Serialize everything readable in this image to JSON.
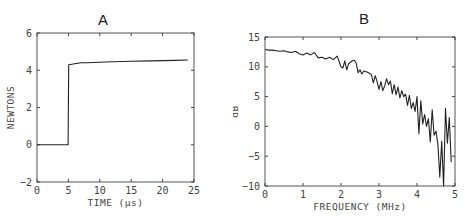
{
  "chart_data": [
    {
      "id": "A",
      "type": "line",
      "title": "A",
      "xlabel": "TIME (µs)",
      "ylabel": "NEWTONS",
      "xlim": [
        0,
        25
      ],
      "ylim": [
        -2,
        6
      ],
      "xticks": [
        "0",
        "5",
        "10",
        "15",
        "20",
        "25"
      ],
      "yticks": [
        "-2",
        "0",
        "2",
        "4",
        "6"
      ],
      "grid": false,
      "series": [
        {
          "name": "force",
          "x": [
            0,
            4.95,
            5.0,
            5.05,
            6,
            7,
            8,
            10,
            12,
            15,
            18,
            20,
            22,
            24
          ],
          "y": [
            0,
            0,
            2.2,
            4.3,
            4.35,
            4.4,
            4.4,
            4.43,
            4.46,
            4.48,
            4.5,
            4.52,
            4.53,
            4.55
          ]
        }
      ]
    },
    {
      "id": "B",
      "type": "line",
      "title": "B",
      "xlabel": "FREQUENCY (MHz)",
      "ylabel": "dB",
      "xlim": [
        0,
        5
      ],
      "ylim": [
        -10,
        15
      ],
      "xticks": [
        "0",
        "1",
        "2",
        "3",
        "4",
        "5"
      ],
      "yticks": [
        "-10",
        "-5",
        "0",
        "5",
        "10",
        "15"
      ],
      "grid": false,
      "series": [
        {
          "name": "spectrum",
          "x": [
            0,
            0.1,
            0.2,
            0.3,
            0.4,
            0.5,
            0.6,
            0.7,
            0.8,
            0.9,
            1.0,
            1.1,
            1.2,
            1.3,
            1.4,
            1.5,
            1.6,
            1.7,
            1.8,
            1.9,
            2.0,
            2.05,
            2.1,
            2.15,
            2.2,
            2.3,
            2.35,
            2.4,
            2.45,
            2.5,
            2.55,
            2.6,
            2.7,
            2.8,
            2.85,
            2.9,
            2.95,
            3.0,
            3.05,
            3.1,
            3.15,
            3.2,
            3.25,
            3.3,
            3.35,
            3.4,
            3.45,
            3.5,
            3.55,
            3.6,
            3.65,
            3.7,
            3.75,
            3.8,
            3.85,
            3.9,
            3.95,
            4.0,
            4.05,
            4.1,
            4.15,
            4.2,
            4.25,
            4.3,
            4.35,
            4.4,
            4.45,
            4.5,
            4.55,
            4.6,
            4.65,
            4.7,
            4.75,
            4.8,
            4.85,
            4.9
          ],
          "y": [
            12.9,
            12.8,
            12.8,
            12.7,
            12.6,
            12.7,
            12.5,
            12.4,
            12.6,
            12.2,
            12.0,
            12.3,
            12.0,
            12.4,
            11.5,
            11.6,
            11.3,
            11.6,
            11.2,
            11.8,
            10.0,
            9.8,
            11.0,
            9.5,
            10.5,
            11.0,
            11.1,
            10.6,
            9.0,
            9.5,
            8.8,
            9.3,
            9.1,
            8.7,
            7.3,
            8.5,
            7.5,
            6.2,
            7.5,
            6.0,
            6.8,
            8.0,
            7.0,
            7.6,
            5.5,
            7.0,
            5.3,
            6.6,
            4.8,
            6.0,
            5.0,
            5.4,
            3.5,
            5.2,
            3.0,
            4.0,
            2.5,
            5.0,
            -1.2,
            4.3,
            0.4,
            2.0,
            0.0,
            1.3,
            -2.6,
            2.8,
            -1.5,
            -0.8,
            -3.0,
            -8.5,
            -2.5,
            -10.0,
            3.0,
            -2.8,
            1.5,
            -6.0
          ]
        }
      ]
    }
  ]
}
